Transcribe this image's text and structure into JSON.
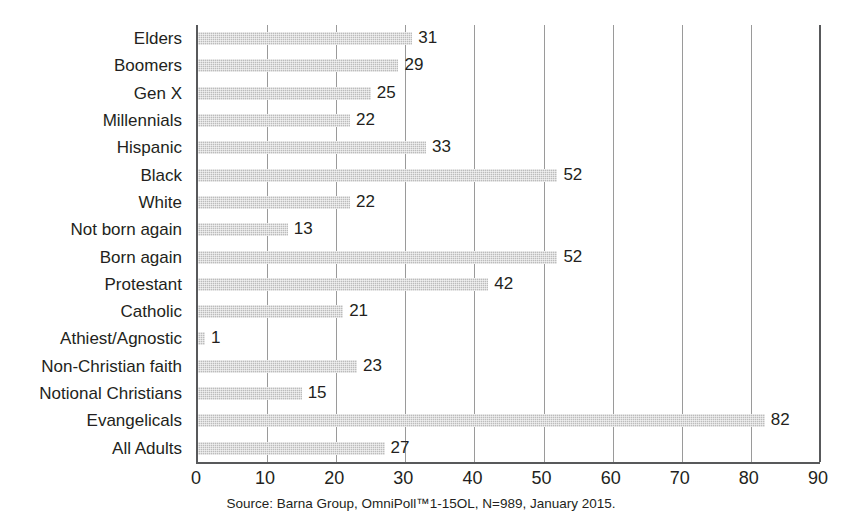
{
  "chart_data": {
    "type": "bar",
    "orientation": "horizontal",
    "title": "",
    "xlabel": "",
    "ylabel": "",
    "xlim": [
      0,
      90
    ],
    "xticks": [
      0,
      10,
      20,
      30,
      40,
      50,
      60,
      70,
      80,
      90
    ],
    "grid": true,
    "legend": false,
    "bar_color": "#bcbcbc",
    "axis_color": "#58595b",
    "gridline_color": "#9a9a9a",
    "text_color": "#231f20",
    "categories": [
      "Elders",
      "Boomers",
      "Gen X",
      "Millennials",
      "Hispanic",
      "Black",
      "White",
      "Not born again",
      "Born again",
      "Protestant",
      "Catholic",
      "Athiest/Agnostic",
      "Non-Christian faith",
      "Notional Christians",
      "Evangelicals",
      "All Adults"
    ],
    "values": [
      31,
      29,
      25,
      22,
      33,
      52,
      22,
      13,
      52,
      42,
      21,
      1,
      23,
      15,
      82,
      27
    ],
    "value_labels": [
      "31",
      "29",
      "25",
      "22",
      "33",
      "52",
      "22",
      "13",
      "52",
      "42",
      "21",
      "1",
      "23",
      "15",
      "82",
      "27"
    ],
    "source": "Source: Barna Group, OmniPoll™1-15OL, N=989, January 2015."
  }
}
